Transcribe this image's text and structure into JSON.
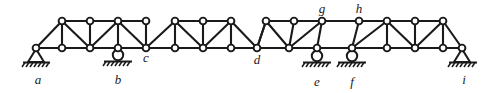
{
  "figure": {
    "kind": "structural-truss-diagram",
    "width": 492,
    "height": 93,
    "background_color": "#ffffff",
    "member_color": "#1a1a1a",
    "node_fill_color": "#ffffff",
    "node_stroke_color": "#1a1a1a"
  },
  "labels": [
    {
      "id": "a",
      "text": "a",
      "x": 38,
      "y": 84,
      "position": "below"
    },
    {
      "id": "b",
      "text": "b",
      "x": 118,
      "y": 84,
      "position": "below"
    },
    {
      "id": "c",
      "text": "c",
      "x": 146,
      "y": 62,
      "position": "below-right"
    },
    {
      "id": "d",
      "text": "d",
      "x": 257,
      "y": 64,
      "position": "below"
    },
    {
      "id": "e",
      "text": "e",
      "x": 317,
      "y": 86,
      "position": "below"
    },
    {
      "id": "f",
      "text": "f",
      "x": 352,
      "y": 86,
      "position": "below"
    },
    {
      "id": "g",
      "text": "g",
      "x": 322,
      "y": 13,
      "position": "above"
    },
    {
      "id": "h",
      "text": "h",
      "x": 359,
      "y": 13,
      "position": "above"
    },
    {
      "id": "i",
      "text": "i",
      "x": 464,
      "y": 84,
      "position": "below"
    }
  ],
  "supports": [
    {
      "id": "support-a",
      "at_node": "a",
      "type": "pin",
      "x": 36,
      "y": 51
    },
    {
      "id": "support-b",
      "at_node": "b",
      "type": "roller",
      "x": 118,
      "y": 51
    },
    {
      "id": "support-e",
      "at_node": "e",
      "type": "roller",
      "x": 317,
      "y": 51
    },
    {
      "id": "support-f",
      "at_node": "f",
      "type": "roller",
      "x": 352,
      "y": 51
    },
    {
      "id": "support-i",
      "at_node": "i",
      "type": "pin",
      "x": 462,
      "y": 51
    }
  ],
  "geometry": {
    "top_chord_y": 21,
    "bottom_chord_y": 48,
    "node_radius": 3.4,
    "top_nodes": [
      {
        "id": "T1",
        "x": 62
      },
      {
        "id": "T2",
        "x": 90
      },
      {
        "id": "T3",
        "x": 118
      },
      {
        "id": "T4",
        "x": 146
      },
      {
        "id": "T5",
        "x": 175
      },
      {
        "id": "T6",
        "x": 203
      },
      {
        "id": "T7",
        "x": 231
      },
      {
        "id": "g",
        "x": 322
      },
      {
        "id": "h",
        "x": 359
      },
      {
        "id": "T10",
        "x": 387
      },
      {
        "id": "T11",
        "x": 415
      },
      {
        "id": "T12",
        "x": 443
      },
      {
        "id": "T8",
        "x": 266
      },
      {
        "id": "T9",
        "x": 294
      }
    ],
    "bottom_nodes": [
      {
        "id": "a",
        "x": 36
      },
      {
        "id": "B1",
        "x": 62
      },
      {
        "id": "B2",
        "x": 90
      },
      {
        "id": "b",
        "x": 118
      },
      {
        "id": "c",
        "x": 146
      },
      {
        "id": "B3",
        "x": 175
      },
      {
        "id": "B4",
        "x": 203
      },
      {
        "id": "B5",
        "x": 231
      },
      {
        "id": "d",
        "x": 257
      },
      {
        "id": "B6",
        "x": 289
      },
      {
        "id": "e",
        "x": 317
      },
      {
        "id": "f",
        "x": 352
      },
      {
        "id": "B7",
        "x": 387
      },
      {
        "id": "B8",
        "x": 415
      },
      {
        "id": "B9",
        "x": 443
      },
      {
        "id": "i",
        "x": 462
      }
    ]
  },
  "panel_notes": {
    "link_span": "g-h panel is an unbraced rectangle (suspended link span)",
    "end_panels": "sloped end posts from a and i rise to the top chord"
  }
}
